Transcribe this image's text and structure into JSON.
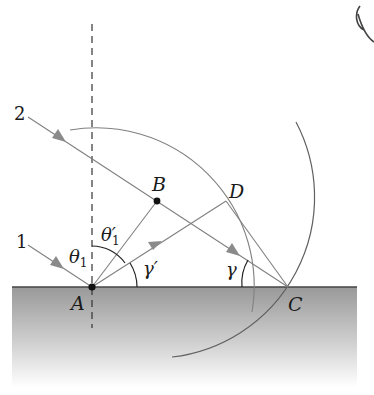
{
  "figure": {
    "colors": {
      "line": "#7a7a7a",
      "dark": "#1a1a1a",
      "arrow": "#808080",
      "surface_top": "#9a9a9a",
      "surface_bottom": "#ffffff"
    },
    "labels": {
      "ray1": "1",
      "ray2": "2",
      "point_A": "A",
      "point_B": "B",
      "point_C": "C",
      "point_D": "D",
      "theta1": "θ",
      "theta1_sub": "1",
      "theta1_prime": "θ′",
      "theta1_prime_sub": "1",
      "gamma_prime": "γ′",
      "gamma": "γ"
    },
    "points": {
      "A": [
        92,
        287
      ],
      "B": [
        157,
        201
      ],
      "C": [
        288,
        287
      ],
      "D": [
        226,
        201
      ]
    },
    "elements": [
      "normal (dashed vertical line through A)",
      "incident ray 1 to A",
      "incident ray 2 through B to C",
      "reflected ray A to D",
      "segment A-B",
      "segment D-C",
      "wavelet arc centered at A through D",
      "wavelet arc centered at B through C",
      "reflecting surface (shaded)"
    ],
    "annotation": "handwritten mark top-right"
  }
}
